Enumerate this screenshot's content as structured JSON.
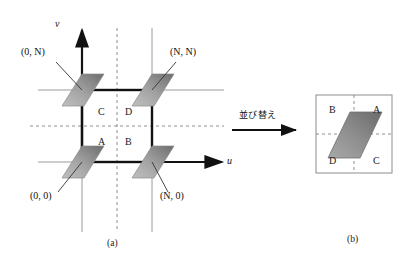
{
  "figure": {
    "panel_a": {
      "caption": "(a)",
      "axis_u_label": "u",
      "axis_v_label": "v",
      "corner_labels": [
        {
          "name": "origin",
          "text": "(0, 0)"
        },
        {
          "name": "bottom-right",
          "text": "(N, 0)"
        },
        {
          "name": "top-left",
          "text": "(0, N)"
        },
        {
          "name": "top-right",
          "text": "(N, N)"
        }
      ],
      "quadrants": [
        {
          "name": "quadrant-c",
          "text": "C"
        },
        {
          "name": "quadrant-d",
          "text": "D"
        },
        {
          "name": "quadrant-a",
          "text": "A"
        },
        {
          "name": "quadrant-b",
          "text": "B"
        }
      ]
    },
    "transform": {
      "label": "並び替え",
      "arrow": "right-arrow"
    },
    "panel_b": {
      "caption": "(b)",
      "quadrants": [
        {
          "name": "quadrant-b",
          "text": "B"
        },
        {
          "name": "quadrant-a",
          "text": "A"
        },
        {
          "name": "quadrant-d",
          "text": "D"
        },
        {
          "name": "quadrant-c",
          "text": "C"
        }
      ]
    },
    "colors": {
      "ink": "#111111",
      "thin_line": "#9a9a9a",
      "dashed_line": "#8e8e8e",
      "tile_light": "#b4b4b4",
      "tile_dark": "#6f6f6f",
      "panel_border": "#8e8e8e"
    }
  }
}
